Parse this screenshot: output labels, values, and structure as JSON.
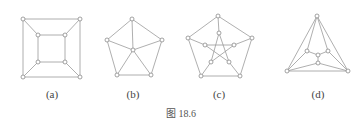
{
  "figure": {
    "caption": "图 18.6",
    "panels": [
      {
        "id": "a",
        "label": "(a)",
        "label_pos": [
          52,
          96
        ],
        "nodes": [
          [
            23,
            19
          ],
          [
            80,
            19
          ],
          [
            23,
            77
          ],
          [
            80,
            77
          ],
          [
            38,
            35
          ],
          [
            65,
            35
          ],
          [
            38,
            62
          ],
          [
            65,
            62
          ]
        ],
        "edges": [
          [
            0,
            1
          ],
          [
            1,
            3
          ],
          [
            3,
            2
          ],
          [
            2,
            0
          ],
          [
            4,
            5
          ],
          [
            5,
            7
          ],
          [
            7,
            6
          ],
          [
            6,
            4
          ],
          [
            0,
            4
          ],
          [
            1,
            5
          ],
          [
            2,
            6
          ],
          [
            3,
            7
          ]
        ]
      },
      {
        "id": "b",
        "label": "(b)",
        "label_pos": [
          133,
          96
        ],
        "nodes": [
          [
            132,
            19
          ],
          [
            107,
            40
          ],
          [
            162,
            40
          ],
          [
            117,
            75
          ],
          [
            151,
            75
          ],
          [
            133,
            50
          ]
        ],
        "edges": [
          [
            0,
            1
          ],
          [
            0,
            2
          ],
          [
            1,
            3
          ],
          [
            2,
            4
          ],
          [
            3,
            4
          ],
          [
            5,
            0
          ],
          [
            5,
            1
          ],
          [
            5,
            2
          ],
          [
            5,
            3
          ],
          [
            5,
            4
          ]
        ]
      },
      {
        "id": "c",
        "label": "(c)",
        "label_pos": [
          219,
          96
        ],
        "nodes": [
          [
            218,
            16
          ],
          [
            188,
            38
          ],
          [
            252,
            38
          ],
          [
            201,
            76
          ],
          [
            240,
            76
          ],
          [
            219,
            33
          ],
          [
            205,
            45
          ],
          [
            234,
            45
          ],
          [
            211,
            62
          ],
          [
            229,
            62
          ]
        ],
        "edges": [
          [
            0,
            2
          ],
          [
            2,
            4
          ],
          [
            4,
            3
          ],
          [
            3,
            1
          ],
          [
            1,
            0
          ],
          [
            0,
            5
          ],
          [
            1,
            6
          ],
          [
            2,
            7
          ],
          [
            3,
            8
          ],
          [
            4,
            9
          ],
          [
            5,
            8
          ],
          [
            5,
            9
          ],
          [
            6,
            7
          ],
          [
            6,
            9
          ],
          [
            7,
            8
          ]
        ]
      },
      {
        "id": "d",
        "label": "(d)",
        "label_pos": [
          318,
          96
        ],
        "nodes": [
          [
            317,
            16
          ],
          [
            287,
            71
          ],
          [
            348,
            71
          ],
          [
            307,
            51
          ],
          [
            318,
            55
          ],
          [
            328,
            51
          ],
          [
            318,
            63
          ]
        ],
        "edges": [
          [
            0,
            1
          ],
          [
            0,
            2
          ],
          [
            1,
            2
          ],
          [
            0,
            3
          ],
          [
            0,
            5
          ],
          [
            3,
            4
          ],
          [
            5,
            4
          ],
          [
            4,
            6
          ],
          [
            3,
            1
          ],
          [
            5,
            2
          ],
          [
            6,
            1
          ],
          [
            6,
            2
          ]
        ]
      }
    ],
    "caption_pos": [
      181,
      112
    ]
  }
}
